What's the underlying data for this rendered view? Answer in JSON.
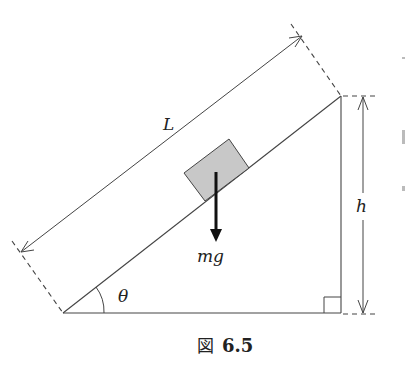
{
  "figure": {
    "caption": "図 6.5",
    "caption_prefix": "図",
    "caption_number": "6.5"
  },
  "labels": {
    "length": "L",
    "height": "h",
    "force": "mg",
    "angle": "θ"
  },
  "colors": {
    "line": "#333333",
    "block_fill": "#c8c8c8",
    "arrow": "#111111",
    "background": "#ffffff"
  },
  "geometry": {
    "incline_bottom_left": [
      63,
      313
    ],
    "incline_top": [
      341,
      96
    ],
    "right_angle_corner": [
      341,
      313
    ],
    "block_corners": [
      [
        184,
        173
      ],
      [
        229,
        139
      ],
      [
        249,
        168
      ],
      [
        205,
        201
      ]
    ],
    "force_arrow": {
      "from": [
        216,
        172
      ],
      "to": [
        216,
        242
      ]
    }
  }
}
